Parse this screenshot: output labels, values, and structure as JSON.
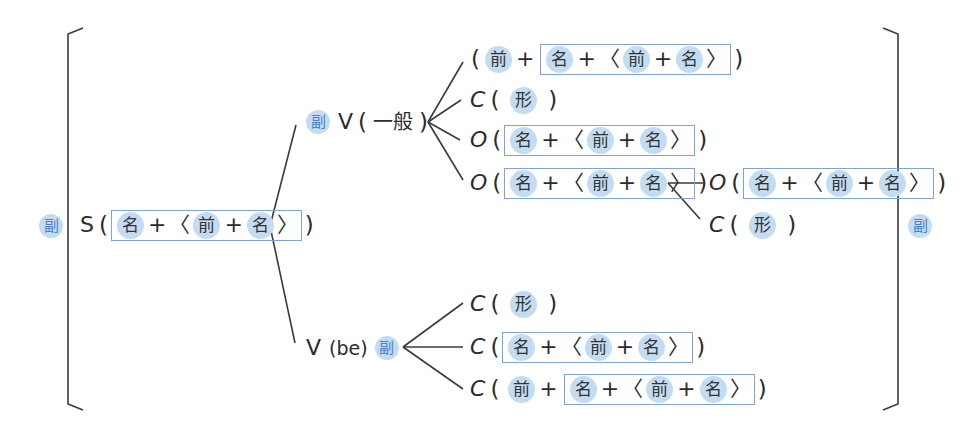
{
  "colors": {
    "pill_bg": "#c3dcf2",
    "box_border": "#7ea4cf",
    "adverb_text": "#4a82c2",
    "line": "#3a3a3a"
  },
  "labels": {
    "adverb": "副",
    "noun": "名",
    "prep": "前",
    "adj": "形",
    "plus": "+",
    "lang": "〈",
    "rang": "〉",
    "lpar": "(",
    "rpar": ")"
  },
  "left_adverb": "副",
  "right_adverb": "副",
  "subject": {
    "role": "S",
    "phrase": [
      "名",
      "+",
      "〈",
      "前",
      "+",
      "名",
      "〉"
    ]
  },
  "branch_general": {
    "pre_adverb": "副",
    "verb": "V",
    "verb_kind": "一般",
    "complements": [
      {
        "role": "",
        "lead": [
          "前",
          "+"
        ],
        "boxed": [
          "名",
          "+",
          "〈",
          "前",
          "+",
          "名",
          "〉"
        ]
      },
      {
        "role": "C",
        "single": "形"
      },
      {
        "role": "O",
        "boxed": [
          "名",
          "+",
          "〈",
          "前",
          "+",
          "名",
          "〉"
        ]
      },
      {
        "role": "O",
        "boxed": [
          "名",
          "+",
          "〈",
          "前",
          "+",
          "名",
          "〉"
        ]
      }
    ],
    "sub_branch": [
      {
        "role": "O",
        "boxed": [
          "名",
          "+",
          "〈",
          "前",
          "+",
          "名",
          "〉"
        ]
      },
      {
        "role": "C",
        "single": "形"
      }
    ]
  },
  "branch_be": {
    "verb": "V",
    "verb_kind": "be",
    "post_adverb": "副",
    "complements": [
      {
        "role": "C",
        "single": "形"
      },
      {
        "role": "C",
        "boxed": [
          "名",
          "+",
          "〈",
          "前",
          "+",
          "名",
          "〉"
        ]
      },
      {
        "role": "C",
        "lead": [
          "前",
          "+"
        ],
        "boxed": [
          "名",
          "+",
          "〈",
          "前",
          "+",
          "名",
          "〉"
        ]
      }
    ]
  }
}
